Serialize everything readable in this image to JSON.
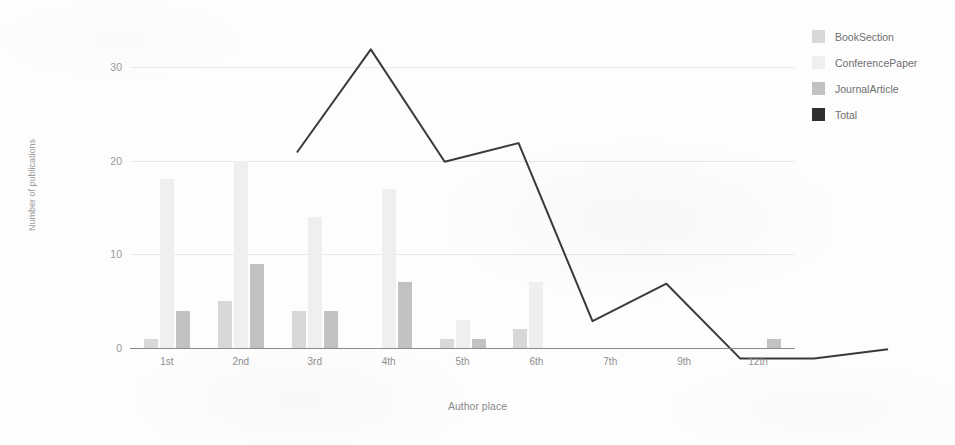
{
  "chart_data": {
    "type": "bar",
    "title": "",
    "subtitle": "",
    "xlabel": "Author place",
    "ylabel": "Number of publications",
    "categories": [
      "1st",
      "2nd",
      "3rd",
      "4th",
      "5th",
      "6th",
      "7th",
      "9th",
      "12th"
    ],
    "ylim": [
      0,
      35
    ],
    "yticks": [
      0,
      10,
      20,
      30
    ],
    "ytick_labels": [
      "0",
      "10",
      "20",
      "30"
    ],
    "grid": true,
    "legend_position": "right",
    "series": [
      {
        "name": "BookSection",
        "type": "bar",
        "color": "#d8d8d8",
        "values": [
          1,
          5,
          4,
          0,
          1,
          2,
          0,
          0,
          0
        ]
      },
      {
        "name": "ConferencePaper",
        "type": "bar",
        "color": "#efefef",
        "values": [
          18,
          20,
          14,
          17,
          3,
          7,
          0,
          0,
          0
        ]
      },
      {
        "name": "JournalArticle",
        "type": "bar",
        "color": "#c2c2c2",
        "values": [
          4,
          9,
          4,
          7,
          1,
          0,
          0,
          0,
          1
        ]
      },
      {
        "name": "Total",
        "type": "line",
        "color": "#3a3a3a",
        "values": [
          23,
          34,
          22,
          24,
          5,
          9,
          1,
          1,
          2
        ]
      }
    ]
  },
  "legend": {
    "items": [
      {
        "label": "BookSection",
        "color": "#d8d8d8"
      },
      {
        "label": "ConferencePaper",
        "color": "#efefef"
      },
      {
        "label": "JournalArticle",
        "color": "#c2c2c2"
      },
      {
        "label": "Total",
        "color": "#2e2e2e"
      }
    ]
  }
}
